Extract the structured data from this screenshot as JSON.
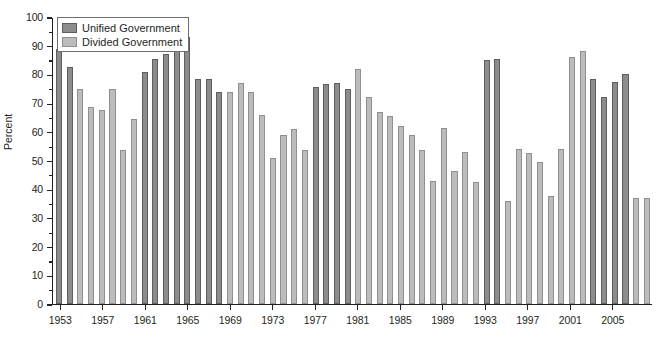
{
  "chart_data": {
    "type": "bar",
    "title": "",
    "subtitle": "",
    "xlabel": "",
    "ylabel": "Percent",
    "ylim": [
      0,
      100
    ],
    "ytick_step": 10,
    "ytick_labels": [
      "0",
      "10",
      "20",
      "30",
      "40",
      "50",
      "60",
      "70",
      "80",
      "90",
      "100"
    ],
    "grid": false,
    "legend_position": "top-left",
    "legend": [
      "Unified Government",
      "Divided Government"
    ],
    "series": [
      {
        "name": "Unified Government",
        "color": "#8c8c8c"
      },
      {
        "name": "Divided Government",
        "color": "#bcbcbc"
      }
    ],
    "x_tick_labels": [
      "1953",
      "1957",
      "1961",
      "1965",
      "1969",
      "1973",
      "1977",
      "1981",
      "1985",
      "1989",
      "1993",
      "1997",
      "2001",
      "2005"
    ],
    "categories": [
      "1953",
      "1954",
      "1955",
      "1956",
      "1957",
      "1958",
      "1959",
      "1960",
      "1961",
      "1962",
      "1963",
      "1964",
      "1965",
      "1966",
      "1967",
      "1968",
      "1969",
      "1970",
      "1971",
      "1972",
      "1973",
      "1974",
      "1975",
      "1976",
      "1977",
      "1978",
      "1979",
      "1980",
      "1981",
      "1982",
      "1983",
      "1984",
      "1985",
      "1986",
      "1987",
      "1988",
      "1989",
      "1990",
      "1991",
      "1992",
      "1993",
      "1994",
      "1995",
      "1996",
      "1997",
      "1998",
      "1999",
      "2000",
      "2001",
      "2002",
      "2003",
      "2004",
      "2005",
      "2006",
      "2007",
      "2008"
    ],
    "points": [
      {
        "year": "1953",
        "value": 89,
        "series": "Unified Government"
      },
      {
        "year": "1954",
        "value": 82.5,
        "series": "Unified Government"
      },
      {
        "year": "1955",
        "value": 75,
        "series": "Divided Government"
      },
      {
        "year": "1956",
        "value": 68.5,
        "series": "Divided Government"
      },
      {
        "year": "1957",
        "value": 67.5,
        "series": "Divided Government"
      },
      {
        "year": "1958",
        "value": 75,
        "series": "Divided Government"
      },
      {
        "year": "1959",
        "value": 53.5,
        "series": "Divided Government"
      },
      {
        "year": "1960",
        "value": 64.5,
        "series": "Divided Government"
      },
      {
        "year": "1961",
        "value": 81,
        "series": "Unified Government"
      },
      {
        "year": "1962",
        "value": 85.5,
        "series": "Unified Government"
      },
      {
        "year": "1963",
        "value": 87,
        "series": "Unified Government"
      },
      {
        "year": "1964",
        "value": 88,
        "series": "Unified Government"
      },
      {
        "year": "1965",
        "value": 93,
        "series": "Unified Government"
      },
      {
        "year": "1966",
        "value": 78.5,
        "series": "Unified Government"
      },
      {
        "year": "1967",
        "value": 78.5,
        "series": "Unified Government"
      },
      {
        "year": "1968",
        "value": 74,
        "series": "Unified Government"
      },
      {
        "year": "1969",
        "value": 74,
        "series": "Divided Government"
      },
      {
        "year": "1970",
        "value": 77,
        "series": "Divided Government"
      },
      {
        "year": "1971",
        "value": 74,
        "series": "Divided Government"
      },
      {
        "year": "1972",
        "value": 66,
        "series": "Divided Government"
      },
      {
        "year": "1973",
        "value": 51,
        "series": "Divided Government"
      },
      {
        "year": "1974",
        "value": 59,
        "series": "Divided Government"
      },
      {
        "year": "1975",
        "value": 61,
        "series": "Divided Government"
      },
      {
        "year": "1976",
        "value": 53.5,
        "series": "Divided Government"
      },
      {
        "year": "1977",
        "value": 75.5,
        "series": "Unified Government"
      },
      {
        "year": "1978",
        "value": 76.5,
        "series": "Unified Government"
      },
      {
        "year": "1979",
        "value": 77,
        "series": "Unified Government"
      },
      {
        "year": "1980",
        "value": 75,
        "series": "Unified Government"
      },
      {
        "year": "1981",
        "value": 82,
        "series": "Divided Government"
      },
      {
        "year": "1982",
        "value": 72,
        "series": "Divided Government"
      },
      {
        "year": "1983",
        "value": 67,
        "series": "Divided Government"
      },
      {
        "year": "1984",
        "value": 65.5,
        "series": "Divided Government"
      },
      {
        "year": "1985",
        "value": 62,
        "series": "Divided Government"
      },
      {
        "year": "1986",
        "value": 59,
        "series": "Divided Government"
      },
      {
        "year": "1987",
        "value": 53.5,
        "series": "Divided Government"
      },
      {
        "year": "1988",
        "value": 43,
        "series": "Divided Government"
      },
      {
        "year": "1989",
        "value": 61.5,
        "series": "Divided Government"
      },
      {
        "year": "1990",
        "value": 46.5,
        "series": "Divided Government"
      },
      {
        "year": "1991",
        "value": 53,
        "series": "Divided Government"
      },
      {
        "year": "1992",
        "value": 42.5,
        "series": "Divided Government"
      },
      {
        "year": "1993",
        "value": 85,
        "series": "Unified Government"
      },
      {
        "year": "1994",
        "value": 85.5,
        "series": "Unified Government"
      },
      {
        "year": "1995",
        "value": 36,
        "series": "Divided Government"
      },
      {
        "year": "1996",
        "value": 54,
        "series": "Divided Government"
      },
      {
        "year": "1997",
        "value": 52.5,
        "series": "Divided Government"
      },
      {
        "year": "1998",
        "value": 49.5,
        "series": "Divided Government"
      },
      {
        "year": "1999",
        "value": 37.5,
        "series": "Divided Government"
      },
      {
        "year": "2000",
        "value": 54,
        "series": "Divided Government"
      },
      {
        "year": "2001",
        "value": 86,
        "series": "Divided Government"
      },
      {
        "year": "2002",
        "value": 88,
        "series": "Divided Government"
      },
      {
        "year": "2003",
        "value": 78.5,
        "series": "Unified Government"
      },
      {
        "year": "2004",
        "value": 72,
        "series": "Unified Government"
      },
      {
        "year": "2005",
        "value": 77.5,
        "series": "Unified Government"
      },
      {
        "year": "2006",
        "value": 80,
        "series": "Unified Government"
      },
      {
        "year": "2007",
        "value": 37,
        "series": "Divided Government"
      },
      {
        "year": "2008",
        "value": 37,
        "series": "Divided Government"
      }
    ]
  },
  "legend": {
    "unified_label": "Unified Government",
    "divided_label": "Divided Government"
  },
  "axis": {
    "y_title": "Percent"
  },
  "colors": {
    "unified": "#8c8c8c",
    "divided": "#bcbcbc",
    "axis": "#231f20",
    "background": "#ffffff"
  }
}
